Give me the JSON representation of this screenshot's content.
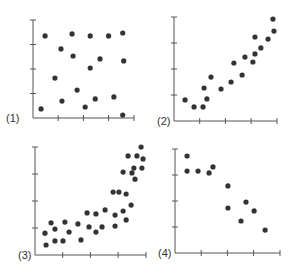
{
  "figure": {
    "width": 298,
    "height": 276,
    "dot_color": "#333333",
    "axis_color": "#555555"
  },
  "chart_data": [
    {
      "type": "scatter",
      "label": "(1)",
      "title": "",
      "xlabel": "",
      "ylabel": "",
      "xticks": 4,
      "yticks": 4,
      "xlim": [
        0,
        4
      ],
      "ylim": [
        0,
        4.0
      ],
      "grid": false,
      "description": "No correlation",
      "layout": {
        "x0": 33,
        "y0": 118,
        "xstep": 25.2,
        "ystep": 24.5,
        "xend": 134,
        "ytop": 20
      },
      "points": [
        [
          0.48,
          3.35
        ],
        [
          1.55,
          3.43
        ],
        [
          2.27,
          3.35
        ],
        [
          3.0,
          3.35
        ],
        [
          3.56,
          3.47
        ],
        [
          1.11,
          2.82
        ],
        [
          1.59,
          2.53
        ],
        [
          2.66,
          2.41
        ],
        [
          3.6,
          2.33
        ],
        [
          2.27,
          2.04
        ],
        [
          0.87,
          1.63
        ],
        [
          1.75,
          1.14
        ],
        [
          1.15,
          0.69
        ],
        [
          2.47,
          0.78
        ],
        [
          3.21,
          0.86
        ],
        [
          0.32,
          0.37
        ],
        [
          2.07,
          0.45
        ],
        [
          3.56,
          0.12
        ]
      ]
    },
    {
      "type": "scatter",
      "label": "(2)",
      "title": "",
      "xlabel": "",
      "ylabel": "",
      "xticks": 4,
      "yticks": 4,
      "xlim": [
        0,
        4
      ],
      "ylim": [
        0,
        4.0
      ],
      "grid": false,
      "description": "Positive linear correlation",
      "layout": {
        "x0": 174,
        "y0": 121,
        "xstep": 25.7,
        "ystep": 26,
        "xend": 277,
        "ytop": 17
      },
      "points": [
        [
          0.43,
          0.81
        ],
        [
          0.78,
          0.54
        ],
        [
          1.13,
          0.54
        ],
        [
          1.28,
          0.85
        ],
        [
          1.17,
          1.27
        ],
        [
          1.44,
          1.69
        ],
        [
          1.83,
          1.23
        ],
        [
          2.22,
          1.5
        ],
        [
          2.33,
          2.23
        ],
        [
          2.65,
          1.77
        ],
        [
          2.76,
          2.46
        ],
        [
          3.07,
          2.27
        ],
        [
          3.15,
          2.58
        ],
        [
          3.15,
          3.23
        ],
        [
          3.38,
          2.81
        ],
        [
          3.66,
          3.15
        ],
        [
          3.89,
          3.46
        ],
        [
          3.85,
          3.92
        ]
      ]
    },
    {
      "type": "scatter",
      "label": "(3)",
      "title": "",
      "xlabel": "",
      "ylabel": "",
      "xticks": 4,
      "yticks": 4,
      "xlim": [
        0,
        4
      ],
      "ylim": [
        0,
        4.0
      ],
      "grid": false,
      "description": "Positive non-linear (curved) correlation",
      "layout": {
        "x0": 35,
        "y0": 255,
        "xstep": 27.7,
        "ystep": 27,
        "xend": 146,
        "ytop": 147
      },
      "points": [
        [
          0.36,
          0.81
        ],
        [
          0.4,
          0.37
        ],
        [
          0.58,
          1.19
        ],
        [
          0.72,
          0.96
        ],
        [
          0.72,
          0.52
        ],
        [
          1.01,
          0.52
        ],
        [
          1.08,
          1.22
        ],
        [
          1.23,
          0.85
        ],
        [
          1.55,
          1.15
        ],
        [
          1.66,
          0.56
        ],
        [
          1.88,
          1.56
        ],
        [
          1.95,
          1.04
        ],
        [
          2.2,
          1.52
        ],
        [
          2.2,
          0.85
        ],
        [
          2.42,
          1.04
        ],
        [
          2.53,
          1.67
        ],
        [
          2.82,
          2.33
        ],
        [
          2.89,
          1.48
        ],
        [
          2.89,
          1.07
        ],
        [
          3.03,
          2.33
        ],
        [
          3.18,
          1.63
        ],
        [
          3.29,
          2.26
        ],
        [
          3.29,
          1.3
        ],
        [
          3.47,
          1.85
        ],
        [
          3.18,
          3.07
        ],
        [
          3.36,
          3.67
        ],
        [
          3.5,
          3.04
        ],
        [
          3.57,
          3.22
        ],
        [
          3.61,
          2.81
        ],
        [
          3.68,
          3.67
        ],
        [
          3.83,
          4.0
        ],
        [
          3.9,
          3.56
        ],
        [
          3.86,
          3.22
        ]
      ]
    },
    {
      "type": "scatter",
      "label": "(4)",
      "title": "",
      "xlabel": "",
      "ylabel": "",
      "xticks": 4,
      "yticks": 4,
      "xlim": [
        0,
        4
      ],
      "ylim": [
        0,
        4.0
      ],
      "grid": false,
      "description": "Negative linear correlation",
      "layout": {
        "x0": 175,
        "y0": 253,
        "xstep": 26.2,
        "ystep": 26,
        "xend": 280,
        "ytop": 149
      },
      "points": [
        [
          0.46,
          3.73
        ],
        [
          0.46,
          3.15
        ],
        [
          0.88,
          3.15
        ],
        [
          1.3,
          3.08
        ],
        [
          1.45,
          3.31
        ],
        [
          2.02,
          2.58
        ],
        [
          2.02,
          1.73
        ],
        [
          2.71,
          1.96
        ],
        [
          3.02,
          1.62
        ],
        [
          2.52,
          1.23
        ],
        [
          3.44,
          0.88
        ]
      ]
    }
  ]
}
